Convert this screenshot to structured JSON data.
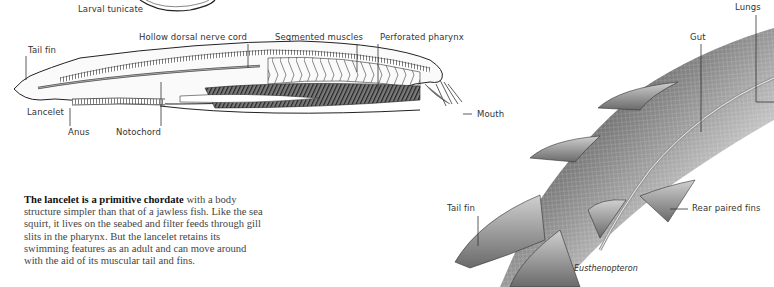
{
  "lancelet_diagram": {
    "labels": {
      "larval_tunicate": "Larval tunicate",
      "hollow_dorsal_nerve_cord": "Hollow dorsal nerve cord",
      "segmented_muscles": "Segmented muscles",
      "perforated_pharynx": "Perforated pharynx",
      "tail_fin": "Tail fin",
      "lancelet": "Lancelet",
      "anus": "Anus",
      "notochord": "Notochord",
      "mouth": "Mouth"
    }
  },
  "caption": {
    "lead": "The lancelet is a primitive chordate",
    "body": " with a body structure simpler than that of a jawless fish. Like the sea squirt, it lives on the seabed and filter feeds through gill slits in the pharynx. But the lancelet retains its swimming features as an adult and can move around with the aid of its muscular tail and fins."
  },
  "fish_diagram": {
    "species": "Eusthenopteron",
    "labels": {
      "lungs": "Lungs",
      "gut": "Gut",
      "tail_fin": "Tail fin",
      "rear_paired_fins": "Rear paired fins"
    }
  }
}
